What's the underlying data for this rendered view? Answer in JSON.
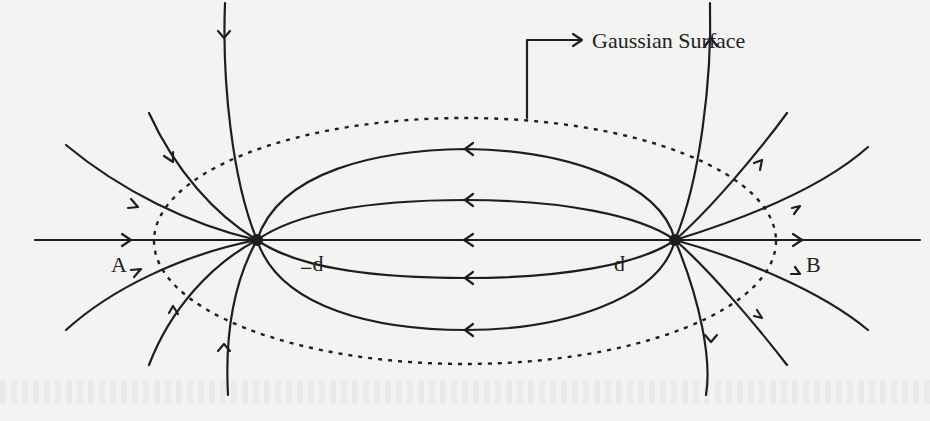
{
  "diagram": {
    "title_label": "Gaussian Surface",
    "charges": [
      {
        "label": "−q",
        "x": 257,
        "y": 240,
        "sign": "negative"
      },
      {
        "label": "q",
        "x": 675,
        "y": 240,
        "sign": "positive"
      }
    ],
    "points": [
      {
        "label": "A",
        "x": 124,
        "y": 272
      },
      {
        "label": "B",
        "x": 815,
        "y": 272
      }
    ],
    "gaussian_surface": {
      "shape": "ellipse",
      "style": "dotted",
      "cx": 465,
      "cy": 241,
      "rx": 311,
      "ry": 123
    },
    "field_line_direction": "from q (right) to −q (left)",
    "colors": {
      "ink": "#1e1e1e",
      "paper": "#f3f3f1"
    }
  }
}
